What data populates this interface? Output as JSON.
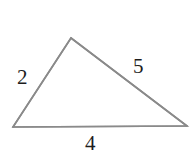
{
  "figure": {
    "type": "triangle-diagram",
    "background_color": "#ffffff",
    "stroke_color": "#8a8a8a",
    "label_color": "#1d1d1d",
    "stroke_width": 1.6,
    "width": 194,
    "height": 164,
    "vertices": {
      "left": {
        "x": 13,
        "y": 127
      },
      "apex": {
        "x": 71,
        "y": 38
      },
      "right": {
        "x": 187,
        "y": 126
      }
    },
    "sides": [
      {
        "id": "left-side",
        "label": "2",
        "from": "left",
        "to": "apex"
      },
      {
        "id": "right-side",
        "label": "5",
        "from": "apex",
        "to": "right"
      },
      {
        "id": "bottom-side",
        "label": "4",
        "from": "left",
        "to": "right"
      }
    ],
    "labels": {
      "left_side": "2",
      "right_side": "5",
      "bottom_side": "4"
    }
  }
}
